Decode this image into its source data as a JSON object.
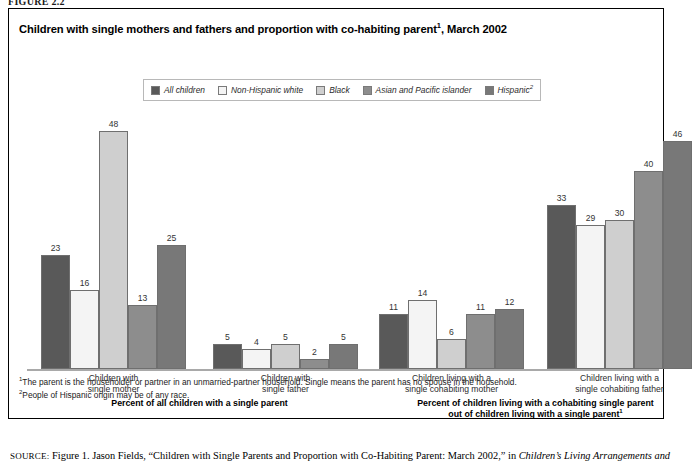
{
  "figure_label": "FIGURE 2.2",
  "title": {
    "text": "Children with single mothers and fathers and proportion with co-habiting parent",
    "superscript": "1",
    "suffix": ", March 2002"
  },
  "legend": {
    "items": [
      {
        "label": "All children",
        "color": "#595959",
        "superscript": ""
      },
      {
        "label": "Non-Hispanic white",
        "color": "#f4f4f4",
        "superscript": ""
      },
      {
        "label": "Black",
        "color": "#cfcfcf",
        "superscript": ""
      },
      {
        "label": "Asian and Pacific islander",
        "color": "#8d8d8d",
        "superscript": ""
      },
      {
        "label": "Hispanic",
        "color": "#787878",
        "superscript": "2"
      }
    ]
  },
  "sections": [
    {
      "label": "Percent of all children with a single parent",
      "superscript": ""
    },
    {
      "label": "Percent of children living with a cohabiting single parent",
      "label2": "out of children living with a single parent",
      "superscript": "1"
    }
  ],
  "footnotes": [
    {
      "marker": "1",
      "text": "The parent is the householder or partner in an unmarried-partner household. Single means the parent has no spouse in the household."
    },
    {
      "marker": "2",
      "text": "People of Hispanic origin may be of any race."
    }
  ],
  "source": {
    "label": "SOURCE:",
    "text_before": " Figure 1. Jason Fields, “Children with Single Parents and Proportion with Co-Habiting Parent: March 2002,” in ",
    "italic": "Children’s Living Arrangements and"
  },
  "chart_data": {
    "type": "bar",
    "xlabel": "",
    "ylabel": "Percent",
    "ylim": [
      0,
      50
    ],
    "grid": false,
    "legend_position": "top",
    "categories": [
      "Children with single mother",
      "Children with single father",
      "Children living with a single cohabiting mother",
      "Children living with a single cohabiting father"
    ],
    "category_lines": [
      [
        "Children with",
        "single mother"
      ],
      [
        "Children with",
        "single father"
      ],
      [
        "Children living with a",
        "single cohabiting mother"
      ],
      [
        "Children living with a",
        "single cohabiting father"
      ]
    ],
    "series": [
      {
        "name": "All children",
        "color": "#595959",
        "values": [
          23,
          5,
          11,
          33
        ]
      },
      {
        "name": "Non-Hispanic white",
        "color": "#f4f4f4",
        "values": [
          16,
          4,
          14,
          29
        ]
      },
      {
        "name": "Black",
        "color": "#cfcfcf",
        "values": [
          48,
          5,
          6,
          30
        ]
      },
      {
        "name": "Asian and Pacific islander",
        "color": "#8d8d8d",
        "values": [
          13,
          2,
          11,
          40
        ]
      },
      {
        "name": "Hispanic",
        "color": "#787878",
        "values": [
          25,
          5,
          12,
          46
        ]
      }
    ]
  }
}
